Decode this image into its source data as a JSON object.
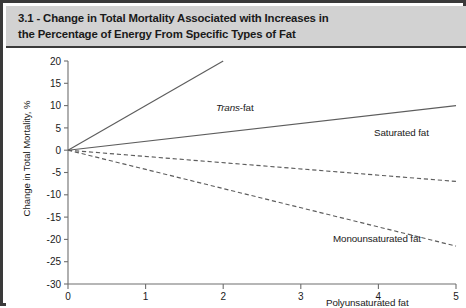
{
  "figure": {
    "number": "3.1",
    "title": "3.1 - Change in Total Mortality Associated with Increases in\nthe Percentage of Energy From Specific Types of Fat"
  },
  "chart_data": {
    "type": "line",
    "title": "Change in Total Mortality Associated with Increases in the Percentage of Energy From Specific Types of Fat",
    "xlabel": "",
    "ylabel": "Change in Total Mortality, %",
    "xlim": [
      0,
      5
    ],
    "ylim": [
      -30,
      20
    ],
    "xticks": [
      0,
      1,
      2,
      3,
      4,
      5
    ],
    "yticks": [
      20,
      15,
      10,
      5,
      0,
      -5,
      -10,
      -15,
      -20,
      -25,
      -30
    ],
    "xtick_labels": [
      "0",
      "1",
      "2",
      "3",
      "4",
      "5"
    ],
    "ytick_labels": [
      "20",
      "15",
      "10",
      "5",
      "0",
      "-5",
      "-10",
      "-15",
      "-20",
      "-25",
      "-30"
    ],
    "grid": false,
    "legend_position": "inline-annotations",
    "series": [
      {
        "name": "Trans-fat",
        "label_html": "<em>Trans</em>-fat",
        "style": "solid",
        "color": "#5d5d5d",
        "x": [
          0,
          2.0
        ],
        "values": [
          0,
          20
        ]
      },
      {
        "name": "Saturated fat",
        "label_html": "Saturated fat",
        "style": "solid",
        "color": "#5d5d5d",
        "x": [
          0,
          5
        ],
        "values": [
          0,
          10
        ]
      },
      {
        "name": "Monounsaturated fat",
        "label_html": "Monounsaturated fat",
        "style": "dashed",
        "color": "#5d5d5d",
        "x": [
          0,
          5
        ],
        "values": [
          0,
          -7
        ]
      },
      {
        "name": "Polyunsaturated fat",
        "label_html": "Polyunsaturated fat",
        "style": "dashed",
        "color": "#5d5d5d",
        "x": [
          0,
          5
        ],
        "values": [
          0,
          -21.5
        ]
      }
    ]
  },
  "colors": {
    "frame": "#3a3a3a",
    "header_band": "#d2d2d2",
    "plot_background": "#ffffff",
    "axis": "#6e6e6e",
    "line": "#5d5d5d",
    "text": "#1a1a1a"
  }
}
